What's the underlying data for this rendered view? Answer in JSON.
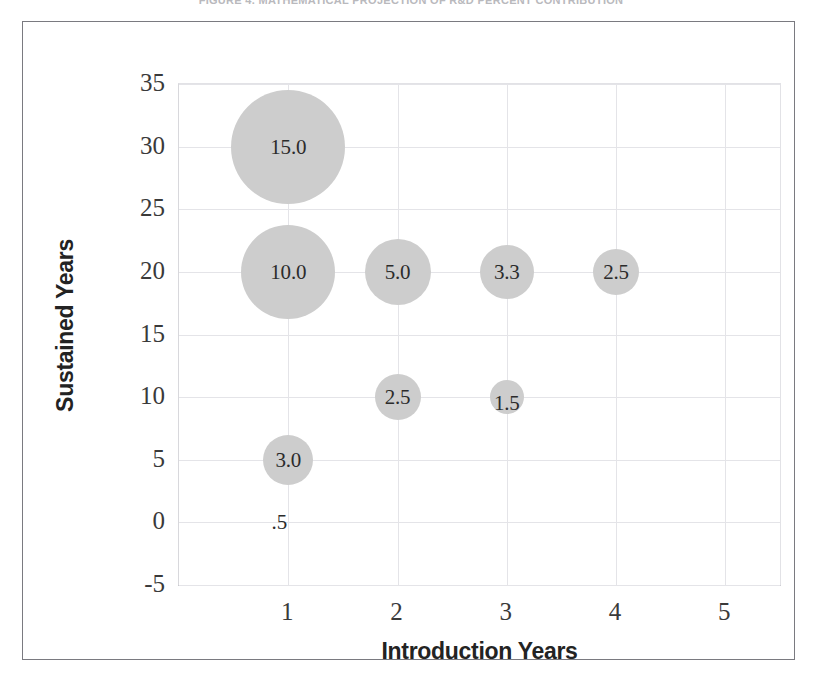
{
  "figure": {
    "caption": "FIGURE 4. MATHEMATICAL PROJECTION OF R&D PERCENT CONTRIBUTION"
  },
  "chart_data": {
    "type": "scatter",
    "title": "",
    "xlabel": "Introduction Years",
    "ylabel": "Sustained Years",
    "xlim": [
      0,
      5.5
    ],
    "ylim": [
      -5,
      35
    ],
    "xticks": [
      "1",
      "2",
      "3",
      "4",
      "5"
    ],
    "xtick_values": [
      1,
      2,
      3,
      4,
      5
    ],
    "yticks": [
      "35",
      "30",
      "25",
      "20",
      "15",
      "10",
      "5",
      "0",
      "-5"
    ],
    "ytick_values": [
      35,
      30,
      25,
      20,
      15,
      10,
      5,
      0,
      -5
    ],
    "grid": true,
    "legend": "none",
    "bubble_color": "#cdcdcd",
    "points": [
      {
        "label": "15.0",
        "x": 1,
        "y": 30,
        "size": 15.0,
        "radius_px": 57
      },
      {
        "label": "10.0",
        "x": 1,
        "y": 20,
        "size": 10.0,
        "radius_px": 47
      },
      {
        "label": "5.0",
        "x": 2,
        "y": 20,
        "size": 5.0,
        "radius_px": 33
      },
      {
        "label": "3.3",
        "x": 3,
        "y": 20,
        "size": 3.3,
        "radius_px": 27
      },
      {
        "label": "2.5",
        "x": 4,
        "y": 20,
        "size": 2.5,
        "radius_px": 23
      },
      {
        "label": "2.5",
        "x": 2,
        "y": 10,
        "size": 2.5,
        "radius_px": 23
      },
      {
        "label": "1.5",
        "x": 3,
        "y": 10,
        "size": 1.5,
        "radius_px": 17
      },
      {
        "label": "3.0",
        "x": 1,
        "y": 5,
        "size": 3.0,
        "radius_px": 25
      },
      {
        "label": ".5",
        "x": 1,
        "y": 0,
        "size": 0.5,
        "radius_px": 0
      }
    ]
  }
}
